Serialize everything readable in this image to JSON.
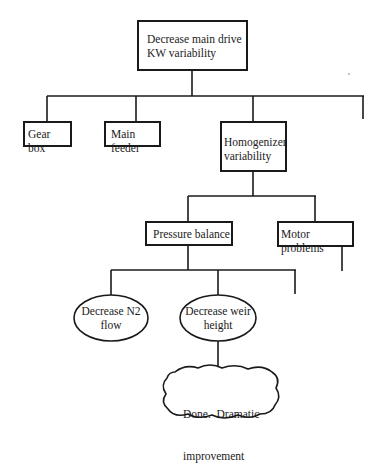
{
  "diagram": {
    "type": "tree",
    "root": {
      "label_line1": "Decrease main drive",
      "label_line2": "KW variability"
    },
    "level1": [
      {
        "label": "Gear box"
      },
      {
        "label": "Main feeder"
      },
      {
        "label_line1": "Homogenizer",
        "label_line2": "variability"
      }
    ],
    "level2": [
      {
        "label": "Pressure balance"
      },
      {
        "label": "Motor problems"
      }
    ],
    "level3": [
      {
        "label_line1": "Decrease N2",
        "label_line2": "flow"
      },
      {
        "label_line1": "Decrease weir",
        "label_line2": "height"
      }
    ],
    "outcome": {
      "label_line1": "Done.  Dramatic",
      "label_line2": "improvement"
    }
  },
  "colors": {
    "line": "#1a1a1a",
    "background": "#ffffff"
  }
}
